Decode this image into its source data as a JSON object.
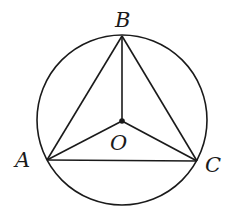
{
  "diagram": {
    "type": "geometry",
    "circle": {
      "center": "O",
      "cx": 122,
      "cy": 120,
      "r": 85
    },
    "points": {
      "A": {
        "x": 47,
        "y": 160,
        "label": "A"
      },
      "B": {
        "x": 122,
        "y": 36,
        "label": "B"
      },
      "C": {
        "x": 197,
        "y": 161,
        "label": "C"
      },
      "O": {
        "x": 122,
        "y": 121,
        "label": "O"
      }
    },
    "segments": [
      "AB",
      "BC",
      "CA",
      "OA",
      "OB",
      "OC"
    ],
    "colors": {
      "stroke": "#1a1a1a",
      "background": "#ffffff"
    }
  }
}
